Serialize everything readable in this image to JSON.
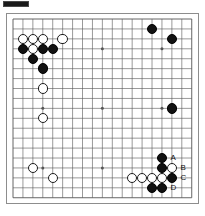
{
  "diagram": {
    "type": "go-board-diagram",
    "board_size": 19,
    "header_fragment": "",
    "star_points": [
      [
        4,
        4
      ],
      [
        10,
        4
      ],
      [
        16,
        4
      ],
      [
        4,
        10
      ],
      [
        10,
        10
      ],
      [
        16,
        10
      ],
      [
        4,
        16
      ],
      [
        10,
        16
      ],
      [
        16,
        16
      ]
    ],
    "colors": {
      "black_stone": "#111111",
      "white_stone": "#ffffff",
      "stone_outline": "#1c1c1c",
      "grid_line": "#555555",
      "board_background": "#ffffff",
      "board_border": "#8d8d8d",
      "label_text": "#111111"
    },
    "black_stones": [
      [
        2,
        4
      ],
      [
        4,
        4
      ],
      [
        5,
        4
      ],
      [
        3,
        5
      ],
      [
        4,
        6
      ],
      [
        15,
        2
      ],
      [
        17,
        3
      ],
      [
        17,
        10
      ],
      [
        16,
        15
      ],
      [
        16,
        16
      ],
      [
        17,
        17
      ],
      [
        15,
        18
      ],
      [
        16,
        18
      ]
    ],
    "white_stones": [
      [
        2,
        3
      ],
      [
        3,
        3
      ],
      [
        4,
        3
      ],
      [
        6,
        3
      ],
      [
        3,
        4
      ],
      [
        4,
        8
      ],
      [
        4,
        11
      ],
      [
        3,
        16
      ],
      [
        5,
        17
      ],
      [
        17,
        16
      ],
      [
        13,
        17
      ],
      [
        14,
        17
      ],
      [
        15,
        17
      ],
      [
        16,
        17
      ]
    ],
    "markers": [
      {
        "label": "A",
        "col": 16,
        "row": 15
      },
      {
        "label": "B",
        "col": 17,
        "row": 16
      },
      {
        "label": "C",
        "col": 17,
        "row": 17
      },
      {
        "label": "D",
        "col": 16,
        "row": 18
      }
    ]
  }
}
